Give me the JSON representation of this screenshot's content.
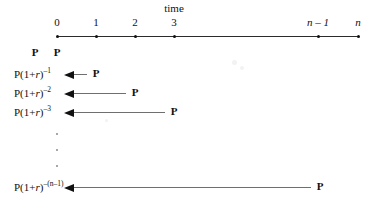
{
  "figure": {
    "caption_time": "time",
    "axis": {
      "ticks": [
        {
          "label": "0",
          "x": 57,
          "italic": false
        },
        {
          "label": "1",
          "x": 96,
          "italic": false
        },
        {
          "label": "2",
          "x": 135,
          "italic": false
        },
        {
          "label": "3",
          "x": 174,
          "italic": false
        },
        {
          "label": "n – 1",
          "x": 318,
          "italic": true
        },
        {
          "label": "n",
          "x": 358,
          "italic": true
        }
      ],
      "line_start_x": 57,
      "line_end_x": 358,
      "line_y": 36
    },
    "payment_symbol": "P",
    "initial_payments": [
      {
        "label": "P",
        "x": 35,
        "y": 46
      },
      {
        "label": "P",
        "x": 57,
        "y": 46
      }
    ],
    "rows": [
      {
        "pv_base": "P(1+",
        "pv_rate": "r",
        "pv_close": ")",
        "exponent": "–1",
        "y_label": 68,
        "arrow_y": 74,
        "arrow_left_x": 73,
        "arrow_right_x": 87,
        "payment_x": 96,
        "payment_label": "P"
      },
      {
        "pv_base": "P(1+",
        "pv_rate": "r",
        "pv_close": ")",
        "exponent": "–2",
        "y_label": 87,
        "arrow_y": 93,
        "arrow_left_x": 73,
        "arrow_right_x": 126,
        "payment_x": 135,
        "payment_label": "P"
      },
      {
        "pv_base": "P(1+",
        "pv_rate": "r",
        "pv_close": ")",
        "exponent": "–3",
        "y_label": 106,
        "arrow_y": 112,
        "arrow_left_x": 73,
        "arrow_right_x": 165,
        "payment_x": 174,
        "payment_label": "P"
      },
      {
        "pv_base": "P(1+",
        "pv_rate": "r",
        "pv_close": ")",
        "exponent": "–(n–1)",
        "y_label": 181,
        "arrow_y": 187,
        "arrow_left_x": 73,
        "arrow_right_x": 311,
        "payment_x": 320,
        "payment_label": "P"
      }
    ],
    "ellipsis_dots": [
      {
        "x": 57,
        "y": 133
      },
      {
        "x": 57,
        "y": 149
      },
      {
        "x": 57,
        "y": 165
      }
    ]
  }
}
